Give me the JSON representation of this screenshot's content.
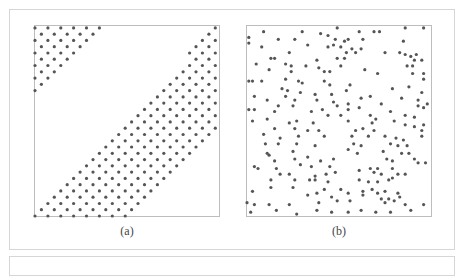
{
  "figure": {
    "panels": [
      {
        "id": "a",
        "caption": "(a)",
        "description": "Regular triangular lattice of points restricted to two diagonal bands"
      },
      {
        "id": "b",
        "caption": "(b)",
        "description": "Random (Poisson-like) scatter of points"
      }
    ],
    "colors": {
      "point": "#555555",
      "axis_frame": "#bdbdbd",
      "outer_frame": "#d6d6d6",
      "caption": "#444444"
    }
  },
  "chart_data": [
    {
      "type": "scatter",
      "title": "(a)",
      "xlabel": "",
      "ylabel": "",
      "xlim": [
        0,
        1
      ],
      "ylim": [
        0,
        1
      ],
      "grid": false,
      "legend": null,
      "pattern": {
        "kind": "triangular-lattice",
        "dx": 0.07,
        "dy": 0.033,
        "bands": [
          {
            "name": "upper-left triangle",
            "rule": "y - x >= 0.62"
          },
          {
            "name": "lower-right diagonal band",
            "rule": "-0.02 <= x - y <= 0.52 and x + y... within frame",
            "lower": -0.02,
            "upper": 0.52
          }
        ]
      }
    },
    {
      "type": "scatter",
      "title": "(b)",
      "xlabel": "",
      "ylabel": "",
      "xlim": [
        0,
        1
      ],
      "ylim": [
        0,
        1
      ],
      "grid": false,
      "legend": null,
      "points": [
        [
          0.49,
          0.99
        ],
        [
          0.86,
          0.99
        ],
        [
          0.96,
          0.99
        ],
        [
          0.09,
          0.97
        ],
        [
          0.3,
          0.97
        ],
        [
          0.4,
          0.96
        ],
        [
          0.61,
          0.97
        ],
        [
          0.69,
          0.97
        ],
        [
          0.72,
          0.97
        ],
        [
          0.01,
          0.94
        ],
        [
          0.17,
          0.93
        ],
        [
          0.26,
          0.93
        ],
        [
          0.44,
          0.95
        ],
        [
          0.48,
          0.93
        ],
        [
          0.53,
          0.92
        ],
        [
          0.55,
          0.93
        ],
        [
          0.63,
          0.93
        ],
        [
          0.85,
          0.92
        ],
        [
          0.01,
          0.91
        ],
        [
          0.08,
          0.89
        ],
        [
          0.33,
          0.9
        ],
        [
          0.44,
          0.89
        ],
        [
          0.47,
          0.9
        ],
        [
          0.51,
          0.89
        ],
        [
          0.57,
          0.88
        ],
        [
          0.62,
          0.88
        ],
        [
          0.23,
          0.86
        ],
        [
          0.54,
          0.86
        ],
        [
          0.59,
          0.86
        ],
        [
          0.75,
          0.86
        ],
        [
          0.83,
          0.86
        ],
        [
          0.86,
          0.85
        ],
        [
          0.92,
          0.85
        ],
        [
          0.89,
          0.84
        ],
        [
          0.13,
          0.83
        ],
        [
          0.15,
          0.83
        ],
        [
          0.38,
          0.82
        ],
        [
          0.49,
          0.83
        ],
        [
          0.53,
          0.83
        ],
        [
          0.91,
          0.82
        ],
        [
          0.95,
          0.82
        ],
        [
          0.05,
          0.8
        ],
        [
          0.21,
          0.8
        ],
        [
          0.24,
          0.79
        ],
        [
          0.32,
          0.79
        ],
        [
          0.39,
          0.78
        ],
        [
          0.51,
          0.79
        ],
        [
          0.87,
          0.79
        ],
        [
          0.9,
          0.79
        ],
        [
          0.12,
          0.77
        ],
        [
          0.24,
          0.76
        ],
        [
          0.42,
          0.76
        ],
        [
          0.45,
          0.76
        ],
        [
          0.64,
          0.77
        ],
        [
          0.71,
          0.75
        ],
        [
          0.9,
          0.75
        ],
        [
          0.96,
          0.75
        ],
        [
          0.01,
          0.71
        ],
        [
          0.03,
          0.71
        ],
        [
          0.08,
          0.71
        ],
        [
          0.21,
          0.72
        ],
        [
          0.28,
          0.71
        ],
        [
          0.3,
          0.7
        ],
        [
          0.42,
          0.71
        ],
        [
          0.45,
          0.69
        ],
        [
          0.56,
          0.69
        ],
        [
          0.96,
          0.72
        ],
        [
          0.88,
          0.68
        ],
        [
          0.79,
          0.67
        ],
        [
          0.19,
          0.67
        ],
        [
          0.22,
          0.66
        ],
        [
          0.29,
          0.65
        ],
        [
          0.37,
          0.64
        ],
        [
          0.46,
          0.64
        ],
        [
          0.54,
          0.66
        ],
        [
          0.62,
          0.62
        ],
        [
          0.67,
          0.63
        ],
        [
          0.84,
          0.62
        ],
        [
          0.93,
          0.61
        ],
        [
          0.04,
          0.63
        ],
        [
          0.21,
          0.63
        ],
        [
          0.26,
          0.61
        ],
        [
          0.95,
          0.65
        ],
        [
          0.93,
          0.58
        ],
        [
          0.11,
          0.61
        ],
        [
          0.38,
          0.61
        ],
        [
          0.47,
          0.6
        ],
        [
          0.49,
          0.58
        ],
        [
          0.55,
          0.59
        ],
        [
          0.61,
          0.57
        ],
        [
          0.73,
          0.59
        ],
        [
          0.98,
          0.59
        ],
        [
          0.01,
          0.56
        ],
        [
          0.04,
          0.56
        ],
        [
          0.17,
          0.58
        ],
        [
          0.25,
          0.58
        ],
        [
          0.41,
          0.56
        ],
        [
          0.55,
          0.56
        ],
        [
          0.78,
          0.55
        ],
        [
          0.96,
          0.57
        ],
        [
          0.15,
          0.55
        ],
        [
          0.35,
          0.55
        ],
        [
          0.44,
          0.53
        ],
        [
          0.51,
          0.53
        ],
        [
          0.67,
          0.53
        ],
        [
          0.86,
          0.53
        ],
        [
          0.91,
          0.52
        ],
        [
          0.03,
          0.5
        ],
        [
          0.11,
          0.51
        ],
        [
          0.23,
          0.49
        ],
        [
          0.27,
          0.5
        ],
        [
          0.36,
          0.49
        ],
        [
          0.55,
          0.5
        ],
        [
          0.68,
          0.49
        ],
        [
          0.7,
          0.51
        ],
        [
          0.8,
          0.5
        ],
        [
          0.86,
          0.48
        ],
        [
          0.96,
          0.48
        ],
        [
          0.15,
          0.46
        ],
        [
          0.26,
          0.46
        ],
        [
          0.33,
          0.45
        ],
        [
          0.39,
          0.45
        ],
        [
          0.59,
          0.45
        ],
        [
          0.63,
          0.46
        ],
        [
          0.69,
          0.45
        ],
        [
          0.91,
          0.47
        ],
        [
          0.95,
          0.45
        ],
        [
          0.09,
          0.43
        ],
        [
          0.18,
          0.41
        ],
        [
          0.28,
          0.42
        ],
        [
          0.42,
          0.42
        ],
        [
          0.57,
          0.42
        ],
        [
          0.66,
          0.42
        ],
        [
          0.75,
          0.42
        ],
        [
          0.81,
          0.41
        ],
        [
          0.85,
          0.4
        ],
        [
          0.95,
          0.42
        ],
        [
          0.1,
          0.38
        ],
        [
          0.17,
          0.38
        ],
        [
          0.27,
          0.38
        ],
        [
          0.37,
          0.37
        ],
        [
          0.58,
          0.38
        ],
        [
          0.62,
          0.37
        ],
        [
          0.78,
          0.38
        ],
        [
          0.82,
          0.37
        ],
        [
          0.87,
          0.37
        ],
        [
          0.11,
          0.33
        ],
        [
          0.12,
          0.32
        ],
        [
          0.25,
          0.34
        ],
        [
          0.55,
          0.35
        ],
        [
          0.6,
          0.33
        ],
        [
          0.74,
          0.34
        ],
        [
          0.84,
          0.33
        ],
        [
          0.88,
          0.33
        ],
        [
          0.15,
          0.29
        ],
        [
          0.26,
          0.3
        ],
        [
          0.33,
          0.31
        ],
        [
          0.4,
          0.29
        ],
        [
          0.47,
          0.3
        ],
        [
          0.76,
          0.3
        ],
        [
          0.79,
          0.29
        ],
        [
          0.91,
          0.3
        ],
        [
          0.97,
          0.28
        ],
        [
          0.04,
          0.26
        ],
        [
          0.06,
          0.25
        ],
        [
          0.16,
          0.25
        ],
        [
          0.29,
          0.27
        ],
        [
          0.35,
          0.26
        ],
        [
          0.45,
          0.26
        ],
        [
          0.67,
          0.25
        ],
        [
          0.71,
          0.25
        ],
        [
          0.79,
          0.25
        ],
        [
          0.93,
          0.28
        ],
        [
          0.18,
          0.22
        ],
        [
          0.23,
          0.22
        ],
        [
          0.37,
          0.21
        ],
        [
          0.43,
          0.22
        ],
        [
          0.48,
          0.23
        ],
        [
          0.61,
          0.24
        ],
        [
          0.69,
          0.23
        ],
        [
          0.73,
          0.22
        ],
        [
          0.82,
          0.22
        ],
        [
          0.86,
          0.22
        ],
        [
          0.13,
          0.19
        ],
        [
          0.26,
          0.19
        ],
        [
          0.34,
          0.19
        ],
        [
          0.37,
          0.19
        ],
        [
          0.44,
          0.18
        ],
        [
          0.61,
          0.19
        ],
        [
          0.66,
          0.18
        ],
        [
          0.71,
          0.18
        ],
        [
          0.77,
          0.19
        ],
        [
          0.79,
          0.2
        ],
        [
          0.03,
          0.13
        ],
        [
          0.13,
          0.15
        ],
        [
          0.25,
          0.15
        ],
        [
          0.42,
          0.14
        ],
        [
          0.51,
          0.14
        ],
        [
          0.63,
          0.13
        ],
        [
          0.68,
          0.14
        ],
        [
          0.71,
          0.12
        ],
        [
          0.75,
          0.13
        ],
        [
          0.82,
          0.12
        ],
        [
          0.33,
          0.11
        ],
        [
          0.38,
          0.12
        ],
        [
          0.46,
          0.1
        ],
        [
          0.55,
          0.12
        ],
        [
          0.63,
          0.11
        ],
        [
          0.73,
          0.09
        ],
        [
          0.77,
          0.09
        ],
        [
          0.83,
          0.1
        ],
        [
          0.0,
          0.07
        ],
        [
          0.04,
          0.06
        ],
        [
          0.12,
          0.06
        ],
        [
          0.23,
          0.06
        ],
        [
          0.39,
          0.07
        ],
        [
          0.49,
          0.08
        ],
        [
          0.56,
          0.08
        ],
        [
          0.75,
          0.07
        ],
        [
          0.8,
          0.08
        ],
        [
          0.86,
          0.06
        ],
        [
          0.96,
          0.06
        ],
        [
          0.02,
          0.02
        ],
        [
          0.16,
          0.03
        ],
        [
          0.27,
          0.01
        ],
        [
          0.38,
          0.03
        ],
        [
          0.46,
          0.02
        ],
        [
          0.55,
          0.02
        ],
        [
          0.62,
          0.03
        ],
        [
          0.7,
          0.02
        ],
        [
          0.78,
          0.02
        ],
        [
          0.89,
          0.03
        ]
      ]
    }
  ]
}
